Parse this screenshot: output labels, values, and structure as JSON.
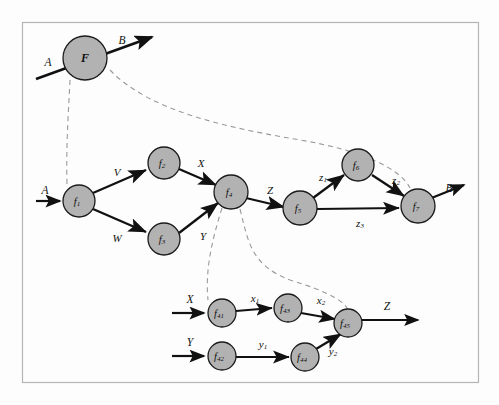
{
  "figure": {
    "kind": "hierarchical-function-decomposition-diagram",
    "frame": {
      "x": 22,
      "y": 22,
      "width": 456,
      "height": 360
    },
    "colors": {
      "node_fill": "#b2b2b2",
      "node_stroke": "#1b1b1b",
      "edge": "#111111",
      "dashed_link": "#9a9a9a",
      "frame": "#b4b4b4",
      "background": "#fdfdfd"
    }
  },
  "levels": {
    "top": {
      "name": "top-level-function",
      "node": {
        "id": "F",
        "label": "F",
        "cx": 85,
        "cy": 58,
        "r": 22
      },
      "input": {
        "label": "A",
        "label_x": 48,
        "label_y": 62,
        "x1": 36,
        "y1": 78,
        "x2": 152,
        "y2": 38
      },
      "output": {
        "label": "B",
        "label_x": 122,
        "label_y": 40
      }
    },
    "middle": {
      "name": "middle-level-network",
      "nodes": [
        {
          "id": "f1",
          "label": "f",
          "sub": "1",
          "cx": 79,
          "cy": 201,
          "r": 16
        },
        {
          "id": "f2",
          "label": "f",
          "sub": "2",
          "cx": 164,
          "cy": 163,
          "r": 16
        },
        {
          "id": "f3",
          "label": "f",
          "sub": "3",
          "cx": 164,
          "cy": 239,
          "r": 16
        },
        {
          "id": "f4",
          "label": "f",
          "sub": "4",
          "cx": 231,
          "cy": 192,
          "r": 17
        },
        {
          "id": "f5",
          "label": "f",
          "sub": "5",
          "cx": 300,
          "cy": 208,
          "r": 17
        },
        {
          "id": "f6",
          "label": "f",
          "sub": "6",
          "cx": 358,
          "cy": 165,
          "r": 16
        },
        {
          "id": "f7",
          "label": "f",
          "sub": "7",
          "cx": 418,
          "cy": 206,
          "r": 17
        }
      ],
      "edges": [
        {
          "from": "f1",
          "to": "f2",
          "label": "V",
          "label_x": 117,
          "label_y": 172
        },
        {
          "from": "f1",
          "to": "f3",
          "label": "W",
          "label_x": 117,
          "label_y": 238
        },
        {
          "from": "f2",
          "to": "f4",
          "label": "X",
          "label_x": 201,
          "label_y": 163
        },
        {
          "from": "f3",
          "to": "f4",
          "label": "Y",
          "label_x": 203,
          "label_y": 236
        },
        {
          "from": "f4",
          "to": "f5",
          "label": "Z",
          "label_x": 270,
          "label_y": 190
        },
        {
          "from": "f5",
          "to": "f6",
          "label": "z",
          "sub": "1",
          "label_x": 323,
          "label_y": 177
        },
        {
          "from": "f6",
          "to": "f7",
          "label": "z",
          "sub": "2",
          "label_x": 396,
          "label_y": 180
        },
        {
          "from": "f5",
          "to": "f7",
          "label": "z",
          "sub": "3",
          "label_x": 360,
          "label_y": 223
        }
      ],
      "input": {
        "label": "A",
        "label_x": 45,
        "label_y": 192
      },
      "output": {
        "label": "B",
        "label_x": 449,
        "label_y": 188
      }
    },
    "bottom": {
      "name": "bottom-level-network",
      "nodes": [
        {
          "id": "f41",
          "label": "f",
          "sub": "41",
          "cx": 222,
          "cy": 313,
          "r": 14
        },
        {
          "id": "f42",
          "label": "f",
          "sub": "42",
          "cx": 222,
          "cy": 356,
          "r": 14
        },
        {
          "id": "f43",
          "label": "f",
          "sub": "43",
          "cx": 288,
          "cy": 308,
          "r": 14
        },
        {
          "id": "f44",
          "label": "f",
          "sub": "44",
          "cx": 305,
          "cy": 357,
          "r": 14
        },
        {
          "id": "f45",
          "label": "f",
          "sub": "45",
          "cx": 348,
          "cy": 323,
          "r": 14
        }
      ],
      "edges": [
        {
          "from": "f41",
          "to": "f43",
          "label": "x",
          "sub": "1",
          "label_x": 255,
          "label_y": 298
        },
        {
          "from": "f43",
          "to": "f45",
          "label": "x",
          "sub": "2",
          "label_x": 321,
          "label_y": 300
        },
        {
          "from": "f42",
          "to": "f44",
          "label": "y",
          "sub": "1",
          "label_x": 263,
          "label_y": 344
        },
        {
          "from": "f44",
          "to": "f45",
          "label": "y",
          "sub": "2",
          "label_x": 333,
          "label_y": 351
        }
      ],
      "inputs": [
        {
          "label": "X",
          "label_x": 190,
          "label_y": 299
        },
        {
          "label": "Y",
          "label_x": 190,
          "label_y": 342
        }
      ],
      "output": {
        "label": "Z",
        "label_x": 387,
        "label_y": 306
      }
    }
  },
  "dashed_links": [
    {
      "name": "F-to-f1-expansion",
      "path": "M 70,80 C 68,120 66,150 67,185"
    },
    {
      "name": "F-to-B-output-expansion",
      "path": "M 110,70 C 150,112 230,128 300,140 C 360,150 400,168 410,188"
    },
    {
      "name": "f4-to-f41-expansion",
      "path": "M 222,208 C 212,240 205,270 208,300"
    },
    {
      "name": "f4-to-f45-expansion",
      "path": "M 240,209 C 248,240 250,265 290,280 C 330,292 345,302 348,310"
    }
  ]
}
